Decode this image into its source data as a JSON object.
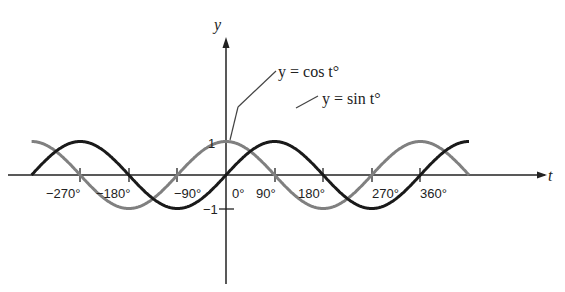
{
  "chart_data": {
    "type": "line",
    "title": "",
    "xlabel": "t",
    "ylabel": "y",
    "x_ticks": [
      "-270°",
      "-180°",
      "-90°",
      "0°",
      "90°",
      "180°",
      "270°",
      "360°"
    ],
    "y_ticks": [
      "1",
      "-1"
    ],
    "xlim": [
      -360,
      450
    ],
    "ylim": [
      -1,
      1
    ],
    "grid": false,
    "series": [
      {
        "name": "y = cos t°",
        "color": "#808080",
        "function": "cos",
        "x_range": [
          -360,
          450
        ]
      },
      {
        "name": "y = sin t°",
        "color": "#1a1a1a",
        "function": "sin",
        "x_range": [
          -360,
          450
        ]
      }
    ],
    "annotations": [
      {
        "text": "y = cos t°",
        "points_to": [
          0,
          1
        ]
      },
      {
        "text": "y = sin t°",
        "points_to": [
          90,
          1
        ]
      }
    ]
  },
  "labels": {
    "y_axis": "y",
    "x_axis": "t",
    "cos_eq": "y = cos t°",
    "sin_eq": "y = sin t°",
    "one": "1",
    "neg_one": "−1",
    "ticks": [
      "−270°",
      "−180°",
      "−90°",
      "0°",
      "90°",
      "180°",
      "270°",
      "360°"
    ]
  }
}
